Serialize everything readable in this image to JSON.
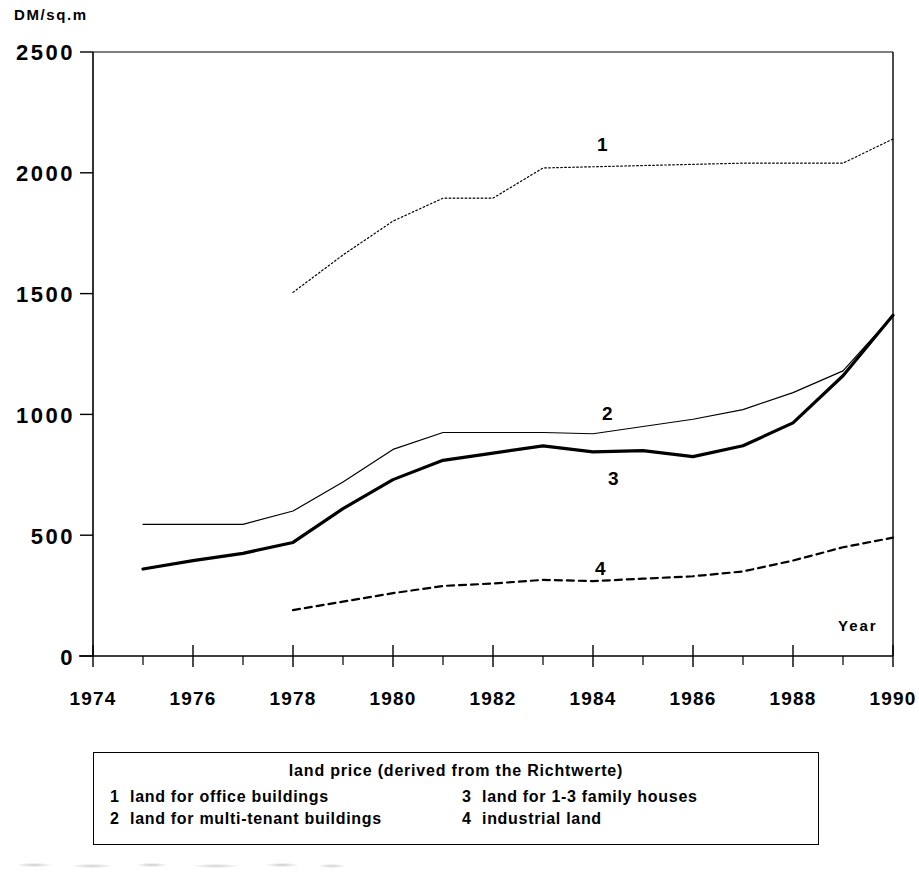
{
  "chart_data": {
    "type": "line",
    "title": "",
    "xlabel": "Year",
    "ylabel": "DM/sq.m",
    "ylim": [
      0,
      2500
    ],
    "xlim": [
      1974,
      1990
    ],
    "yticks": [
      "0",
      "500",
      "1000",
      "1500",
      "2000",
      "2500"
    ],
    "ytick_values": [
      0,
      500,
      1000,
      1500,
      2000,
      2500
    ],
    "xticks": [
      "1974",
      "1976",
      "1978",
      "1980",
      "1982",
      "1984",
      "1986",
      "1988",
      "1990"
    ],
    "xtick_values": [
      1974,
      1976,
      1978,
      1980,
      1982,
      1984,
      1986,
      1988,
      1990
    ],
    "minor_xticks": [
      1975,
      1977,
      1979,
      1981,
      1983,
      1985,
      1987,
      1989
    ],
    "grid": false,
    "legend_position": "below-plot",
    "series": [
      {
        "name": "1",
        "label": "land for office buildings",
        "style": "dotted",
        "color": "#000000",
        "x": [
          1978,
          1979,
          1980,
          1981,
          1982,
          1983,
          1984,
          1985,
          1986,
          1987,
          1988,
          1989,
          1990
        ],
        "values": [
          1505,
          1660,
          1800,
          1895,
          1895,
          2020,
          2025,
          2030,
          2035,
          2040,
          2040,
          2040,
          2140
        ]
      },
      {
        "name": "2",
        "label": "land for multi-tenant buildings",
        "style": "thin-solid",
        "color": "#000000",
        "x": [
          1975,
          1976,
          1977,
          1978,
          1979,
          1980,
          1981,
          1982,
          1983,
          1984,
          1985,
          1986,
          1987,
          1988,
          1989,
          1990
        ],
        "values": [
          545,
          545,
          545,
          600,
          720,
          855,
          925,
          925,
          925,
          920,
          950,
          980,
          1020,
          1090,
          1180,
          1410
        ]
      },
      {
        "name": "3",
        "label": "land for 1-3 family houses",
        "style": "thick-solid",
        "color": "#000000",
        "x": [
          1975,
          1976,
          1977,
          1978,
          1979,
          1980,
          1981,
          1982,
          1983,
          1984,
          1985,
          1986,
          1987,
          1988,
          1989,
          1990
        ],
        "values": [
          360,
          395,
          425,
          470,
          610,
          730,
          810,
          840,
          870,
          845,
          850,
          825,
          870,
          965,
          1160,
          1410
        ]
      },
      {
        "name": "4",
        "label": "industrial land",
        "style": "dashed",
        "color": "#000000",
        "x": [
          1978,
          1979,
          1980,
          1981,
          1982,
          1983,
          1984,
          1985,
          1986,
          1987,
          1988,
          1989,
          1990
        ],
        "values": [
          190,
          225,
          260,
          290,
          300,
          315,
          310,
          320,
          330,
          350,
          395,
          450,
          490
        ]
      }
    ],
    "series_annotations": [
      {
        "text": "1",
        "x": 1983.1,
        "y": 2180
      },
      {
        "text": "2",
        "x": 1983.2,
        "y": 1075
      },
      {
        "text": "3",
        "x": 1984.3,
        "y": 735
      },
      {
        "text": "4",
        "x": 1984.2,
        "y": 380
      }
    ]
  },
  "legend": {
    "title": "land price (derived from the Richtwerte)",
    "entries": [
      {
        "key": "1",
        "label": "land for office buildings"
      },
      {
        "key": "3",
        "label": "land for 1-3 family houses"
      },
      {
        "key": "2",
        "label": "land for multi-tenant buildings"
      },
      {
        "key": "4",
        "label": "industrial land"
      }
    ]
  }
}
